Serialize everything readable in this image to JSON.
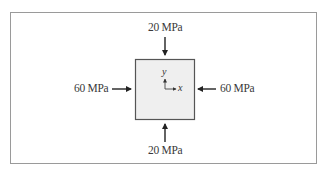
{
  "diagram": {
    "type": "plane-stress-element",
    "element": {
      "fill": "#efefef",
      "stroke": "#555555"
    },
    "stresses": {
      "top": {
        "value": "20",
        "unit": "MPa",
        "label": "20 MPa",
        "direction": "compressive"
      },
      "bottom": {
        "value": "20",
        "unit": "MPa",
        "label": "20 MPa",
        "direction": "compressive"
      },
      "left": {
        "value": "60",
        "unit": "MPa",
        "label": "60 MPa",
        "direction": "compressive"
      },
      "right": {
        "value": "60",
        "unit": "MPa",
        "label": "60 MPa",
        "direction": "compressive"
      }
    },
    "axes": {
      "x": "x",
      "y": "y"
    }
  }
}
